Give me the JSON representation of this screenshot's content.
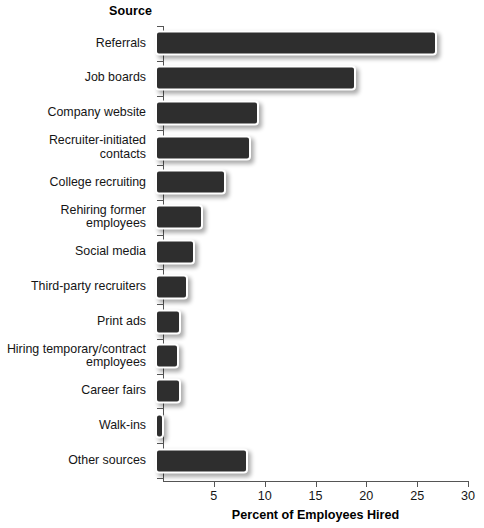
{
  "chart_data": {
    "type": "bar",
    "orientation": "horizontal",
    "title": "",
    "xlabel": "Percent of Employees Hired",
    "ylabel": "Source",
    "xlim": [
      0,
      30
    ],
    "xticks": [
      0,
      5,
      10,
      15,
      20,
      25,
      30
    ],
    "xtick_labels": [
      "",
      "5",
      "10",
      "15",
      "20",
      "25",
      "30"
    ],
    "grid": false,
    "legend": false,
    "bar_color": "#2e2e2e",
    "bar_edge_color": "#ffffff",
    "background_color": "#ffffff",
    "categories": [
      "Referrals",
      "Job boards",
      "Company website",
      "Recruiter-initiated contacts",
      "College recruiting",
      "Rehiring former employees",
      "Social media",
      "Third-party recruiters",
      "Print ads",
      "Hiring temporary/contract\nemployees",
      "Career fairs",
      "Walk-ins",
      "Other sources"
    ],
    "values": [
      27.3,
      19.4,
      9.8,
      9.0,
      6.6,
      4.3,
      3.5,
      2.9,
      2.2,
      2.0,
      2.2,
      0.5,
      8.8
    ]
  }
}
